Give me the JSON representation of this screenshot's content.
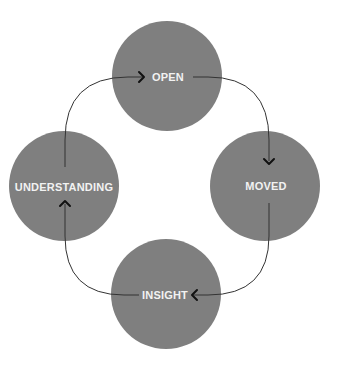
{
  "diagram": {
    "type": "cycle",
    "colors": {
      "node_fill": "#7f7f7f",
      "label": "#f2f2f2",
      "connector": "#333333",
      "background": "#ffffff"
    },
    "nodes": [
      {
        "id": "open",
        "label": "OPEN"
      },
      {
        "id": "moved",
        "label": "MOVED"
      },
      {
        "id": "insight",
        "label": "INSIGHT"
      },
      {
        "id": "understanding",
        "label": "UNDERSTANDING"
      }
    ],
    "edges": [
      {
        "from": "understanding",
        "to": "open",
        "arrow": "arrowhead-right"
      },
      {
        "from": "open",
        "to": "moved",
        "arrow": "arrowhead-down"
      },
      {
        "from": "moved",
        "to": "insight",
        "arrow": "arrowhead-left"
      },
      {
        "from": "insight",
        "to": "understanding",
        "arrow": "arrowhead-up"
      }
    ]
  }
}
